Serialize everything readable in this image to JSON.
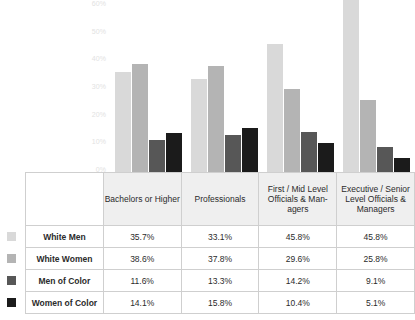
{
  "chart_data": {
    "type": "bar",
    "title": "",
    "subtitle": "",
    "xlabel": "",
    "ylabel": "",
    "ylim": [
      0,
      60
    ],
    "grid": false,
    "legend_position": "row-labels-left",
    "categories": [
      "Bachelors or Higher",
      "Professionals",
      "First / Mid Level Officials & Man-agers",
      "Executive / Senior Level Officials & Managers"
    ],
    "series": [
      {
        "name": "White Men",
        "color": "#d9d9d9",
        "values": [
          35.7,
          33.1,
          45.8,
          45.8
        ],
        "labels": [
          "35.7%",
          "33.1%",
          "45.8%",
          "45.8%"
        ]
      },
      {
        "name": "White Women",
        "color": "#b4b4b4",
        "values": [
          38.6,
          37.8,
          29.6,
          25.8
        ],
        "labels": [
          "38.6%",
          "37.8%",
          "29.6%",
          "25.8%"
        ]
      },
      {
        "name": "Men of Color",
        "color": "#575757",
        "values": [
          11.6,
          13.3,
          14.2,
          9.1
        ],
        "labels": [
          "11.6%",
          "13.3%",
          "14.2%",
          "9.1%"
        ]
      },
      {
        "name": "Women of Color",
        "color": "#1b1b1b",
        "values": [
          14.1,
          15.8,
          10.4,
          5.1
        ],
        "labels": [
          "14.1%",
          "15.8%",
          "10.4%",
          "5.1%"
        ]
      }
    ],
    "yticks": [
      "0%",
      "10%",
      "20%",
      "30%",
      "40%",
      "50%",
      "60%"
    ],
    "ytick_values": [
      0,
      10,
      20,
      30,
      40,
      50,
      60
    ]
  },
  "axis": {
    "ticks": [
      {
        "label": "60%",
        "value": 60
      },
      {
        "label": "50%",
        "value": 50
      },
      {
        "label": "40%",
        "value": 40
      },
      {
        "label": "30%",
        "value": 30
      },
      {
        "label": "20%",
        "value": 20
      },
      {
        "label": "10%",
        "value": 10
      },
      {
        "label": "0%",
        "value": 0
      }
    ]
  },
  "table": {
    "column_headers": [
      "Bachelors or Higher",
      "Professionals",
      "First / Mid Level Officials & Man-agers",
      "Executive / Senior Level Officials & Managers"
    ],
    "rows": [
      {
        "label": "White Men",
        "swatch": "#d9d9d9",
        "cells": [
          "35.7%",
          "33.1%",
          "45.8%",
          "45.8%"
        ]
      },
      {
        "label": "White Women",
        "swatch": "#b4b4b4",
        "cells": [
          "38.6%",
          "37.8%",
          "29.6%",
          "25.8%"
        ]
      },
      {
        "label": "Men of Color",
        "swatch": "#575757",
        "cells": [
          "11.6%",
          "13.3%",
          "14.2%",
          "9.1%"
        ]
      },
      {
        "label": "Women of Color",
        "swatch": "#1b1b1b",
        "cells": [
          "14.1%",
          "15.8%",
          "10.4%",
          "5.1%"
        ]
      }
    ]
  },
  "colors": {
    "series_1": "#d9d9d9",
    "series_2": "#b4b4b4",
    "series_3": "#575757",
    "series_4": "#1b1b1b",
    "header_fill": "#efefef",
    "border": "#cfcfcf",
    "axis_text": "#e2e2e2"
  }
}
